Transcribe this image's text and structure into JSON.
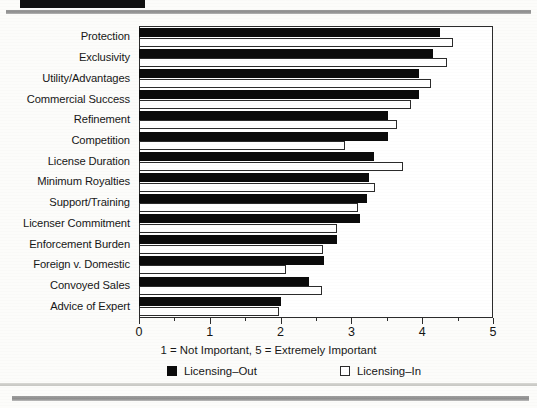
{
  "chart_data": {
    "type": "bar",
    "orientation": "horizontal",
    "title": "",
    "xlabel": "1 = Not Important, 5 = Extremely Important",
    "ylabel": "",
    "xlim": [
      0,
      5
    ],
    "xticks": [
      0,
      1,
      2,
      3,
      4,
      5
    ],
    "xtick_labels": [
      "0",
      "1",
      "2",
      "3",
      "4",
      "5"
    ],
    "minor_ticks": [
      0.5,
      1.5,
      2.5,
      3.5,
      4.5
    ],
    "grid": false,
    "legend_position": "bottom",
    "categories": [
      "Protection",
      "Exclusivity",
      "Utility/Advantages",
      "Commercial Success",
      "Refinement",
      "Competition",
      "License Duration",
      "Minimum Royalties",
      "Support/Training",
      "Licenser Commitment",
      "Enforcement Burden",
      "Foreign v. Domestic",
      "Convoyed Sales",
      "Advice of Expert"
    ],
    "series": [
      {
        "name": "Licensing-Out",
        "color": "#0b0b0b",
        "values": [
          4.25,
          4.15,
          3.95,
          3.95,
          3.52,
          3.52,
          3.32,
          3.25,
          3.22,
          3.12,
          2.8,
          2.62,
          2.4,
          2.0
        ]
      },
      {
        "name": "Licensing-In",
        "color": "#ffffff",
        "values": [
          4.43,
          4.35,
          4.13,
          3.84,
          3.64,
          2.91,
          3.73,
          3.33,
          3.1,
          2.8,
          2.6,
          2.08,
          2.58,
          1.98
        ]
      }
    ]
  },
  "legend": {
    "items": [
      {
        "label": "Licensing–Out",
        "style": "filled"
      },
      {
        "label": "Licensing–In",
        "style": "hollow"
      }
    ]
  }
}
